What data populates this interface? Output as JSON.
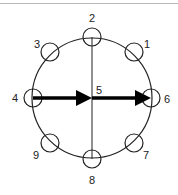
{
  "diagram": {
    "center": {
      "x": 92,
      "y": 98
    },
    "outer_radius": 60,
    "node_radius": 9,
    "stroke_color": "#222222",
    "nodes": [
      {
        "id": "1",
        "label": "1",
        "cx": 134,
        "cy": 52,
        "lx": 147,
        "ly": 44
      },
      {
        "id": "2",
        "label": "2",
        "cx": 92,
        "cy": 37,
        "lx": 92,
        "ly": 18
      },
      {
        "id": "3",
        "label": "3",
        "cx": 50,
        "cy": 52,
        "lx": 37,
        "ly": 44
      },
      {
        "id": "4",
        "label": "4",
        "cx": 33,
        "cy": 98,
        "lx": 15,
        "ly": 98
      },
      {
        "id": "5",
        "label": "5",
        "cx": 92,
        "cy": 98,
        "lx": 99,
        "ly": 90
      },
      {
        "id": "6",
        "label": "6",
        "cx": 151,
        "cy": 98,
        "lx": 167,
        "ly": 99
      },
      {
        "id": "7",
        "label": "7",
        "cx": 134,
        "cy": 143,
        "lx": 146,
        "ly": 155
      },
      {
        "id": "8",
        "label": "8",
        "cx": 92,
        "cy": 159,
        "lx": 92,
        "ly": 180
      },
      {
        "id": "9",
        "label": "9",
        "cx": 50,
        "cy": 143,
        "lx": 36,
        "ly": 155
      }
    ],
    "arrows": [
      {
        "from": "4",
        "to": "5"
      },
      {
        "from": "5",
        "to": "6"
      }
    ]
  }
}
